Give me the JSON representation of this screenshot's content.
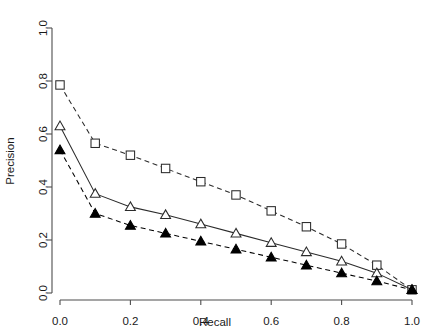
{
  "chart_data": {
    "type": "line",
    "title": "",
    "xlabel": "Recall",
    "ylabel": "Precision",
    "xlim": [
      0.0,
      1.0
    ],
    "ylim": [
      0.0,
      1.0
    ],
    "xticks": [
      "0.0",
      "0.2",
      "0.4",
      "0.6",
      "0.8",
      "1.0"
    ],
    "xtick_values": [
      0.0,
      0.2,
      0.4,
      0.6,
      0.8,
      1.0
    ],
    "yticks": [
      "0.0",
      "0.2",
      "0.4",
      "0.6",
      "0.8",
      "1.0"
    ],
    "ytick_values": [
      0.0,
      0.2,
      0.4,
      0.6,
      0.8,
      1.0
    ],
    "grid": false,
    "legend": "none",
    "x": [
      0.0,
      0.1,
      0.2,
      0.3,
      0.4,
      0.5,
      0.6,
      0.7,
      0.8,
      0.9,
      1.0
    ],
    "series": [
      {
        "name": "open-square-series",
        "marker": "open-square",
        "linestyle": "dashed",
        "color": "#2b2b2b",
        "values": [
          0.785,
          0.565,
          0.52,
          0.47,
          0.42,
          0.37,
          0.31,
          0.25,
          0.185,
          0.105,
          0.012
        ]
      },
      {
        "name": "open-triangle-series",
        "marker": "open-triangle",
        "linestyle": "solid",
        "color": "#2b2b2b",
        "values": [
          0.63,
          0.375,
          0.325,
          0.295,
          0.26,
          0.225,
          0.19,
          0.155,
          0.12,
          0.075,
          0.012
        ]
      },
      {
        "name": "filled-triangle-series",
        "marker": "filled-triangle",
        "linestyle": "dashed",
        "color": "#000000",
        "values": [
          0.54,
          0.3,
          0.255,
          0.225,
          0.195,
          0.165,
          0.135,
          0.105,
          0.075,
          0.045,
          0.012
        ]
      }
    ]
  },
  "axes": {
    "x_axis_label": "Recall",
    "y_axis_label": "Precision"
  },
  "colors": {
    "axis": "#4d4d4d",
    "text": "#1a1a1a",
    "series_outline": "#2b2b2b",
    "series_filled": "#000000",
    "background": "#ffffff"
  }
}
